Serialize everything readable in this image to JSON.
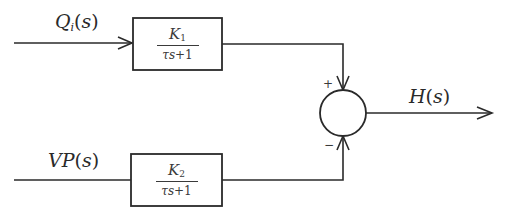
{
  "diagram": {
    "type": "block-diagram",
    "inputs": [
      {
        "id": "Qi",
        "symbol": "Q",
        "subscript": "i",
        "arg": "(s)",
        "display": "Q_i(s)"
      },
      {
        "id": "VP",
        "symbol": "VP",
        "subscript": "",
        "arg": "(s)",
        "display": "VP(s)"
      }
    ],
    "blocks": [
      {
        "id": "G1",
        "numerator_symbol": "K",
        "numerator_subscript": "1",
        "denominator_tau": "τ",
        "denominator_s": "s",
        "denominator_rest": "+1",
        "transfer_function": "K_1/(τs+1)"
      },
      {
        "id": "G2",
        "numerator_symbol": "K",
        "numerator_subscript": "2",
        "denominator_tau": "τ",
        "denominator_s": "s",
        "denominator_rest": "+1",
        "transfer_function": "K_2/(τs+1)"
      }
    ],
    "summing_junction": {
      "top_sign": "+",
      "bottom_sign": "−"
    },
    "output": {
      "id": "H",
      "symbol": "H",
      "arg": "(s)",
      "display": "H(s)"
    },
    "connections": [
      {
        "from": "Qi",
        "to": "G1"
      },
      {
        "from": "VP",
        "to": "G2"
      },
      {
        "from": "G1",
        "to": "sum",
        "sign": "+"
      },
      {
        "from": "G2",
        "to": "sum",
        "sign": "−"
      },
      {
        "from": "sum",
        "to": "H"
      }
    ],
    "colors": {
      "stroke": "#2a2a2a",
      "background": "#ffffff"
    }
  }
}
